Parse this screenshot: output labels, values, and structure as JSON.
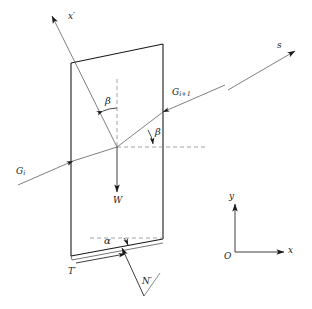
{
  "figure": {
    "background_color": "#ffffff",
    "line_color": "#1a1a1a",
    "dashed_color": "#8a8a8a"
  },
  "labels": {
    "x_prime_axis": "x′",
    "s_axis": "s",
    "force_gi": "G",
    "force_gi_sub": "i",
    "force_gi1": "G",
    "force_gi1_sub": "i+1",
    "weight": "W",
    "shear_force": "T′",
    "normal_force": "N′",
    "angle_beta_top": "β",
    "angle_beta_right": "β",
    "angle_alpha": "α",
    "axis_y": "y",
    "axis_x": "x",
    "origin": "O"
  }
}
